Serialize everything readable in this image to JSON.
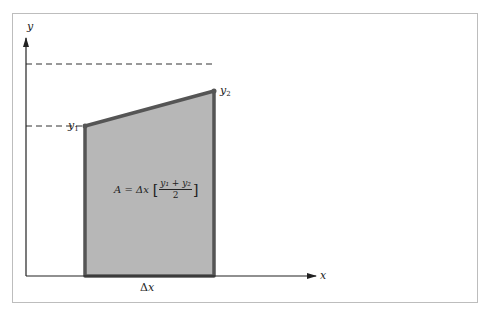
{
  "figure": {
    "axes": {
      "x_label": "x",
      "y_label": "y"
    },
    "points": {
      "y1": {
        "label": "y",
        "subscript": "1"
      },
      "y2": {
        "label": "y",
        "subscript": "2"
      }
    },
    "formula": {
      "lhs": "A = Δx",
      "open_bracket": "[",
      "numerator": "y₁ + y₂",
      "denominator": "2",
      "close_bracket": "]"
    },
    "width_label": {
      "delta": "Δ",
      "var": "x"
    },
    "colors": {
      "fill": "#b7b7b7",
      "outline": "#555555",
      "axis": "#222222",
      "frame": "#bdbdbd"
    }
  }
}
